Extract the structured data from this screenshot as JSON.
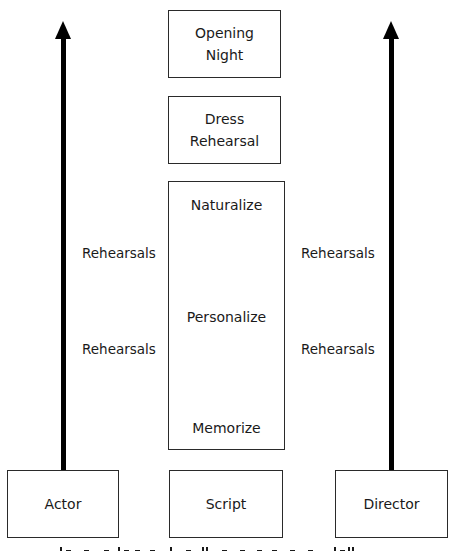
{
  "diagram": {
    "top_boxes": [
      {
        "id": "opening-night",
        "lines": [
          "Opening",
          "Night"
        ]
      },
      {
        "id": "dress-rehearsal",
        "lines": [
          "Dress",
          "Rehearsal"
        ]
      }
    ],
    "stage_box": {
      "steps": [
        "Naturalize",
        "Personalize",
        "Memorize"
      ]
    },
    "bottom_boxes": {
      "actor": "Actor",
      "script": "Script",
      "director": "Director"
    },
    "left_arrow_labels": [
      "Rehearsals",
      "Rehearsals"
    ],
    "right_arrow_labels": [
      "Rehearsals",
      "Rehearsals"
    ],
    "arrows": [
      {
        "from": "Actor",
        "direction": "up"
      },
      {
        "from": "Director",
        "direction": "up"
      }
    ],
    "colors": {
      "line": "#000000",
      "border": "#2a2a2a",
      "text": "#1a1a1a",
      "background": "#ffffff"
    }
  }
}
